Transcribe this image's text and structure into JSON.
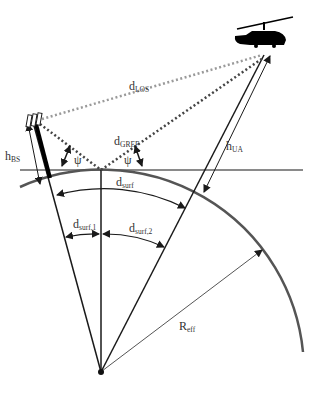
{
  "diagram": {
    "colors": {
      "horizon_line": "#8a8a8a",
      "earth_arc": "#555555",
      "los_dotted": "#9a9a9a",
      "gref_dotted": "#444444",
      "lines": "#1a1a1a"
    },
    "icons": {
      "base_station": "base-station-antenna-icon",
      "aircraft": "helicopter-icon",
      "earth_center": "earth-center-dot-icon"
    },
    "labels": {
      "d_los": {
        "main": "d",
        "sub": "LOS"
      },
      "d_gref": {
        "main": "d",
        "sub": "GREF"
      },
      "h_bs": {
        "main": "h",
        "sub": "BS"
      },
      "h_ua": {
        "main": "h",
        "sub": "UA"
      },
      "psi_left": "ψ",
      "psi_right": "ψ",
      "d_surf": {
        "main": "d",
        "sub": "surf"
      },
      "d_surf_1": {
        "main": "d",
        "sub": "surf,1"
      },
      "d_surf_2": {
        "main": "d",
        "sub": "surf,2"
      },
      "r_eff": {
        "main": "R",
        "sub": "eff"
      }
    }
  }
}
